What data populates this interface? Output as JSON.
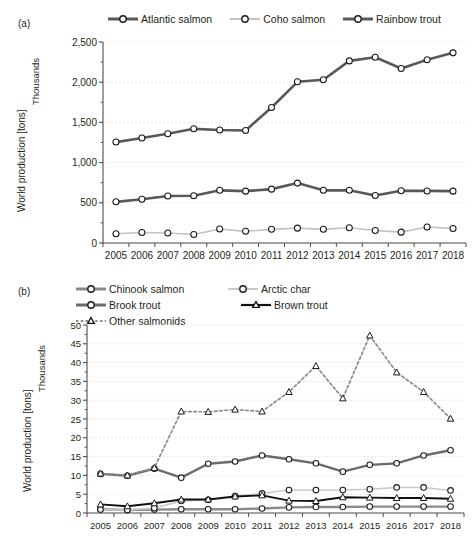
{
  "figure": {
    "panels": [
      {
        "id": "a",
        "label": "(a)",
        "ylabel": "World production [tons]",
        "ysublabel": "Thousands"
      },
      {
        "id": "b",
        "label": "(b)",
        "ylabel": "World production [tons]",
        "ysublabel": "Thousands"
      }
    ]
  },
  "chart_data": [
    {
      "panel": "a",
      "type": "line",
      "title": "",
      "xlabel": "",
      "ylabel": "World production [tons]",
      "ysublabel": "Thousands",
      "ylim": [
        0,
        2500
      ],
      "yticks": [
        0,
        500,
        1000,
        1500,
        2000,
        2500
      ],
      "ytick_labels": [
        "0",
        "500",
        "1,000",
        "1,500",
        "2,000",
        "2,500"
      ],
      "yminor_step": 250,
      "grid": true,
      "legend_position": "top",
      "categories": [
        2005,
        2006,
        2007,
        2008,
        2009,
        2010,
        2011,
        2012,
        2013,
        2014,
        2015,
        2016,
        2017,
        2018
      ],
      "xtick_labels": [
        "2005",
        "2006",
        "2007",
        "2008",
        "2009",
        "2010",
        "2011",
        "2012",
        "2013",
        "2014",
        "2015",
        "2016",
        "2017",
        "2018"
      ],
      "series": [
        {
          "name": "Atlantic salmon",
          "color": "#595959",
          "marker": "circle",
          "linestyle": "solid",
          "linewidth": 2.6,
          "values": [
            1255,
            1305,
            1360,
            1420,
            1405,
            1400,
            1685,
            2005,
            2030,
            2265,
            2310,
            2170,
            2280,
            2365
          ]
        },
        {
          "name": "Coho salmon",
          "color": "#c2c2c2",
          "marker": "circle",
          "linestyle": "solid",
          "linewidth": 1.6,
          "values": [
            115,
            130,
            125,
            105,
            175,
            145,
            170,
            185,
            170,
            190,
            155,
            135,
            200,
            180
          ]
        },
        {
          "name": "Rainbow trout",
          "color": "#595959",
          "marker": "circle",
          "linestyle": "solid",
          "linewidth": 2.6,
          "values": [
            512,
            545,
            585,
            588,
            655,
            645,
            670,
            745,
            655,
            655,
            590,
            650,
            648,
            645
          ]
        }
      ]
    },
    {
      "panel": "b",
      "type": "line",
      "title": "",
      "xlabel": "",
      "ylabel": "World production [tons]",
      "ysublabel": "Thousands",
      "ylim": [
        0,
        50
      ],
      "yticks": [
        0,
        5,
        10,
        15,
        20,
        25,
        30,
        35,
        40,
        45,
        50
      ],
      "ytick_labels": [
        "0",
        "5",
        "10",
        "15",
        "20",
        "25",
        "30",
        "35",
        "40",
        "45",
        "50"
      ],
      "yminor_step": 2.5,
      "grid": true,
      "legend_position": "top",
      "categories": [
        2005,
        2006,
        2007,
        2008,
        2009,
        2010,
        2011,
        2012,
        2013,
        2014,
        2015,
        2016,
        2017,
        2018
      ],
      "xtick_labels": [
        "2005",
        "2006",
        "2007",
        "2008",
        "2009",
        "2010",
        "2011",
        "2012",
        "2013",
        "2014",
        "2015",
        "2016",
        "2017",
        "2018"
      ],
      "series": [
        {
          "name": "Chinook salmon",
          "color": "#8a8a8a",
          "marker": "circle",
          "linestyle": "solid",
          "linewidth": 2.4,
          "values": [
            1.0,
            0.8,
            0.9,
            1.0,
            1.0,
            1.0,
            1.2,
            1.5,
            1.6,
            1.6,
            1.7,
            1.7,
            1.7,
            1.7
          ]
        },
        {
          "name": "Arctic char",
          "color": "#c9c9c9",
          "marker": "circle",
          "linestyle": "solid",
          "linewidth": 1.6,
          "values": [
            0.9,
            0.8,
            1.3,
            3.2,
            3.5,
            4.5,
            5.2,
            6.1,
            6.1,
            6.1,
            6.3,
            6.8,
            6.8,
            6.0
          ]
        },
        {
          "name": "Brook trout",
          "color": "#6b6b6b",
          "marker": "circle",
          "linestyle": "solid",
          "linewidth": 2.4,
          "values": [
            10.4,
            9.9,
            11.8,
            9.4,
            13.1,
            13.7,
            15.3,
            14.3,
            13.2,
            11.0,
            12.8,
            13.2,
            15.3,
            16.7
          ]
        },
        {
          "name": "Brown trout",
          "color": "#111111",
          "marker": "triangle",
          "linestyle": "solid",
          "linewidth": 1.9,
          "values": [
            2.3,
            1.8,
            2.6,
            3.6,
            3.6,
            4.4,
            4.7,
            3.3,
            3.2,
            4.2,
            4.1,
            4.0,
            4.0,
            3.8
          ]
        },
        {
          "name": "Other salmonids",
          "color": "#8a8a8a",
          "marker": "triangle",
          "linestyle": "dotted",
          "linewidth": 1.7,
          "values": [
            10.5,
            10.0,
            12.0,
            27.0,
            26.9,
            27.5,
            27.0,
            32.2,
            39.1,
            30.5,
            47.2,
            37.4,
            32.2,
            25.1
          ]
        }
      ]
    }
  ]
}
